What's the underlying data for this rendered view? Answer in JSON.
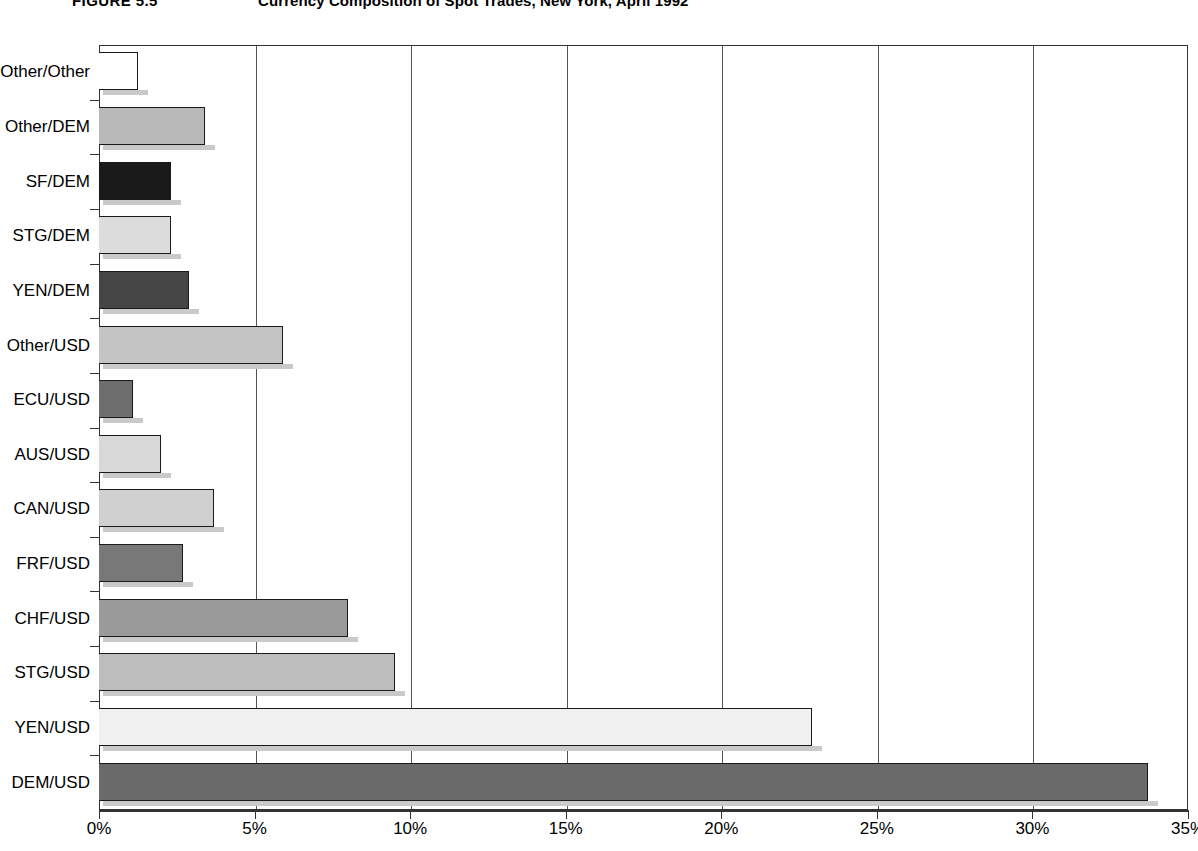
{
  "figure": {
    "number": "FIGURE 5.5",
    "title": "Currency Composition of Spot Trades, New York, April 1992"
  },
  "chart_data": {
    "type": "bar",
    "orientation": "horizontal",
    "title": "Currency Composition of Spot Trades, New York, April 1992",
    "xlabel": "",
    "ylabel": "",
    "xlim": [
      0,
      35
    ],
    "grid": true,
    "legend": "none",
    "xticks": [
      "0%",
      "5%",
      "10%",
      "15%",
      "20%",
      "25%",
      "30%",
      "35%"
    ],
    "xtick_values": [
      0,
      5,
      10,
      15,
      20,
      25,
      30,
      35
    ],
    "categories": [
      "Other/Other",
      "Other/DEM",
      "SF/DEM",
      "STG/DEM",
      "YEN/DEM",
      "Other/USD",
      "ECU/USD",
      "AUS/USD",
      "CAN/USD",
      "FRF/USD",
      "CHF/USD",
      "STG/USD",
      "YEN/USD",
      "DEM/USD"
    ],
    "values": [
      1.25,
      3.4,
      2.3,
      2.3,
      2.9,
      5.9,
      1.1,
      2.0,
      3.7,
      2.7,
      8.0,
      9.5,
      22.9,
      33.7
    ],
    "bar_colors": [
      "#ffffff",
      "#b9b9b9",
      "#1a1a1a",
      "#dcdcdc",
      "#454545",
      "#c4c4c4",
      "#6e6e6e",
      "#d8d8d8",
      "#cfcfcf",
      "#787878",
      "#9a9a9a",
      "#bdbdbd",
      "#f0f0f0",
      "#6a6a6a"
    ]
  },
  "axis": {
    "x_unit": "%",
    "bar_outline_color": "#1a1a1a",
    "gridline_color": "#555555"
  }
}
